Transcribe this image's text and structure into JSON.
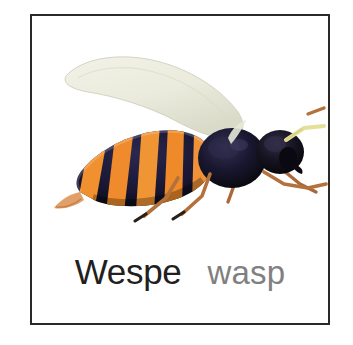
{
  "card": {
    "subject": "wasp-flashcard",
    "border_color": "#2b2826",
    "background_color": "#ffffff"
  },
  "illustration": {
    "name": "wasp-illustration",
    "description": "Side view of a wasp facing right with one pale wing raised, striped abdomen, dark head and thorax",
    "colors": {
      "wing": "#edeee0",
      "wing_shade": "#dcdccb",
      "abdomen_dark": "#1d1b34",
      "abdomen_stripe": "#ef8b3c",
      "abdomen_stripe_light": "#f6a860",
      "thorax": "#12100f",
      "head": "#14121a",
      "leg": "#b3713c",
      "leg_dark": "#2b2018",
      "antenna": "#e4e09a",
      "stinger": "#e0a068"
    }
  },
  "caption": {
    "german_label": "Wespe",
    "english_label": "wasp",
    "german_color": "#231f1e",
    "english_color": "#82807f"
  }
}
